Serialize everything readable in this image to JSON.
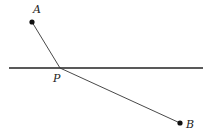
{
  "diagram": {
    "type": "geometry-reflection",
    "colors": {
      "stroke": "#222222",
      "background": "#ffffff"
    },
    "line": {
      "x1": 9,
      "y1": 68,
      "x2": 203,
      "y2": 68
    },
    "points": [
      {
        "id": "A",
        "label": "A",
        "x": 32,
        "y": 22,
        "label_x": 33,
        "label_y": 13
      },
      {
        "id": "P",
        "label": "P",
        "x": 60,
        "y": 68,
        "label_x": 53,
        "label_y": 82
      },
      {
        "id": "B",
        "label": "B",
        "x": 180,
        "y": 123,
        "label_x": 186,
        "label_y": 128
      }
    ],
    "segments": [
      {
        "from": "A",
        "to": "P"
      },
      {
        "from": "P",
        "to": "B"
      }
    ]
  }
}
